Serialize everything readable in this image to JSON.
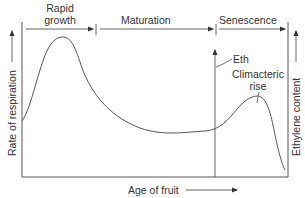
{
  "diagram": {
    "phases": [
      {
        "label_line1": "Rapid",
        "label_line2": "growth"
      },
      {
        "label": "Maturation"
      },
      {
        "label": "Senescence"
      }
    ],
    "y_axis_left_label": "Rate of respiration",
    "y_axis_right_label": "Ethylene content",
    "x_axis_label": "Age of fruit",
    "annotations": {
      "ethylene_short": "Eth",
      "climacteric_line1": "Climacteric",
      "climacteric_line2": "rise"
    },
    "colors": {
      "line": "#555555",
      "text": "#333333",
      "background": "#ffffff"
    }
  }
}
